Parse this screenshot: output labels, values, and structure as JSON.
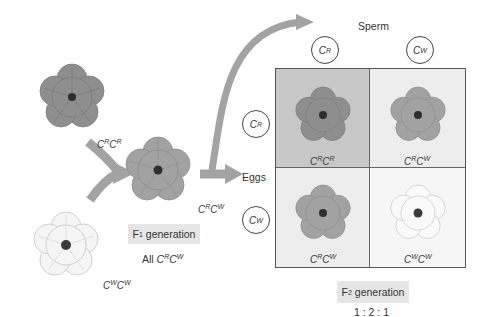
{
  "diagram": {
    "parents": [
      {
        "genotype_base": "C",
        "allele1": "R",
        "allele2": "R",
        "color": "red",
        "tone": "#8c8c8c"
      },
      {
        "genotype_base": "C",
        "allele1": "W",
        "allele2": "W",
        "color": "white",
        "tone": "#f4f4f4"
      }
    ],
    "f1": {
      "genotype_allele1": "R",
      "genotype_allele2": "W",
      "tone": "#9e9e9e",
      "label_main": "F",
      "label_sub": "1",
      "label_rest": " generation",
      "summary_prefix": "All "
    },
    "sperm_label": "Sperm",
    "eggs_label": "Eggs",
    "sperm_alleles": [
      "R",
      "W"
    ],
    "egg_alleles": [
      "R",
      "W"
    ],
    "punnett": [
      {
        "a1": "R",
        "a2": "R",
        "bg": "#c8c8c8",
        "tone": "#8c8c8c"
      },
      {
        "a1": "R",
        "a2": "W",
        "bg": "#ededed",
        "tone": "#a0a0a0"
      },
      {
        "a1": "R",
        "a2": "W",
        "bg": "#ededed",
        "tone": "#a0a0a0"
      },
      {
        "a1": "W",
        "a2": "W",
        "bg": "#f6f6f6",
        "tone": "#f7f7f7"
      }
    ],
    "f2": {
      "label_main": "F",
      "label_sub": "2",
      "label_rest": " generation",
      "ratio": "1 : 2 : 1"
    },
    "allele_letter": "C",
    "arrow_color": "#a3a3a3"
  }
}
